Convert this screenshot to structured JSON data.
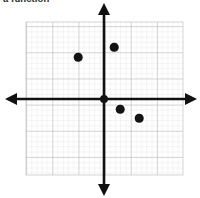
{
  "worksheet": {
    "prompt_text": "a function",
    "background_color": "#ffffff"
  },
  "figure": {
    "name": "coordinate-plane",
    "grid": {
      "minor_line_color": "#d9d9d9",
      "major_line_color": "#a8a8a8",
      "cell_size_px": 5.23,
      "major_every": 5,
      "left_px": 26,
      "top_px": 22,
      "right_px": 183,
      "bottom_px": 175
    },
    "axes": {
      "color": "#111111",
      "stroke_width_px": 2.6,
      "origin_x_px": 104,
      "origin_y_px": 99,
      "x_axis_left_px": 6,
      "x_axis_right_px": 196,
      "y_axis_top_px": 4,
      "y_axis_bottom_px": 195,
      "arrowheads": [
        "left",
        "right",
        "up",
        "down"
      ]
    },
    "origin_dot": {
      "x_px": 104,
      "y_px": 99,
      "radius_px": 4.0,
      "color": "#131313"
    }
  },
  "chart_data": {
    "type": "scatter",
    "title": "",
    "xlabel": "",
    "ylabel": "",
    "xlim": [
      -15,
      15
    ],
    "ylim": [
      -15,
      15
    ],
    "grid": true,
    "legend": false,
    "point_color": "#131313",
    "point_radius_px": 4.3,
    "series": [
      {
        "name": "plotted-points",
        "points": [
          {
            "label": "point-1",
            "x": -5,
            "y": 8,
            "px": 78,
            "py": 57
          },
          {
            "label": "point-2",
            "x": 2,
            "y": 10,
            "px": 114,
            "py": 47
          },
          {
            "label": "point-3",
            "x": 3,
            "y": -2,
            "px": 120,
            "py": 109
          },
          {
            "label": "point-4",
            "x": 7,
            "y": -4,
            "px": 139,
            "py": 118
          }
        ]
      }
    ]
  }
}
